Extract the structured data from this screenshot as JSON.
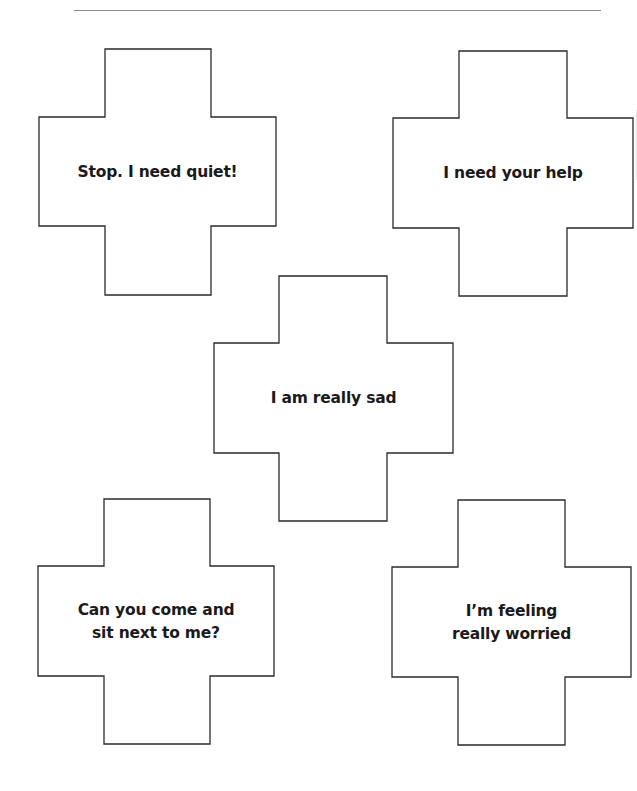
{
  "page": {
    "background": "#ffffff",
    "rule_color": "#8a8a8a",
    "outline_color": "#2a2a2a",
    "text_color": "#1a1a1a"
  },
  "cards": [
    {
      "shape": "cross",
      "lines": [
        "Stop. I need quiet!"
      ]
    },
    {
      "shape": "cross",
      "lines": [
        "I need your help"
      ]
    },
    {
      "shape": "cross",
      "lines": [
        "I am really sad"
      ]
    },
    {
      "shape": "cross",
      "lines": [
        "Can you come and",
        "sit next to me?"
      ]
    },
    {
      "shape": "cross",
      "lines": [
        "I’m feeling",
        "really worried"
      ]
    }
  ]
}
